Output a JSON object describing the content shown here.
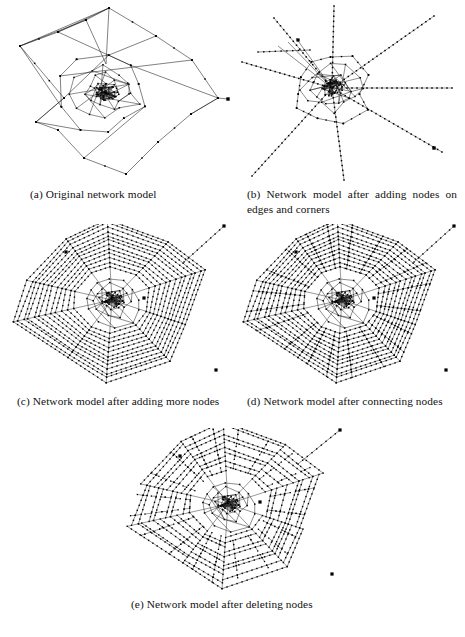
{
  "document": {
    "type": "academic-figure",
    "background_color": "#ffffff",
    "ink_color": "#1a1a1a",
    "node_color": "#000000"
  },
  "figure": {
    "panels": [
      {
        "id": "a",
        "label": "(a)",
        "caption": "Original network model",
        "caption_full": "(a) Original network model",
        "graph": "sparse-planar-network",
        "width": 228,
        "height": 182
      },
      {
        "id": "b",
        "label": "(b)",
        "caption": "Network model after adding nodes on edges and corners",
        "caption_full": "(b) Network model after adding nodes on edges and corners",
        "graph": "radial-spokes-network",
        "width": 224,
        "height": 180
      },
      {
        "id": "c",
        "label": "(c)",
        "caption": "Network model after adding more nodes",
        "caption_full": "(c) Network model after adding more nodes",
        "graph": "dense-web-rings",
        "width": 222,
        "height": 168
      },
      {
        "id": "d",
        "label": "(d)",
        "caption": "Network model after connecting nodes",
        "caption_full": "(d) Network model after connecting nodes",
        "graph": "dense-web-rings-connected",
        "width": 222,
        "height": 168
      },
      {
        "id": "e",
        "label": "(e)",
        "caption": "Network model after deleting nodes",
        "caption_full": "(e) Network model after deleting nodes",
        "graph": "dense-web-rings-pruned",
        "width": 230,
        "height": 168
      }
    ]
  },
  "chart_data": {
    "type": "diagram",
    "stages": [
      "Original network model",
      "Network model after adding nodes on edges and corners",
      "Network model after adding more nodes",
      "Network model after connecting nodes",
      "Network model after deleting nodes"
    ],
    "core_nodes": 46,
    "spoke_count": 8,
    "ring_count": 12,
    "node_marker": "small filled square",
    "edge_style": "thin straight line segments"
  }
}
